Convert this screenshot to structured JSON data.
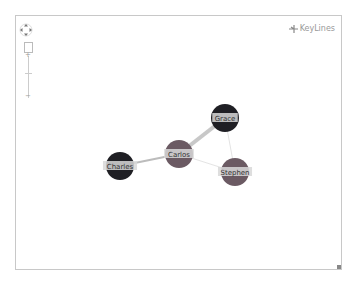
{
  "logo": {
    "text": "KeyLines"
  },
  "controls": {
    "navigate_icon": "pan-arrows-icon",
    "zoom_in": "+",
    "zoom_out": "−"
  },
  "graph": {
    "nodes": [
      {
        "id": "grace",
        "label": "Grace",
        "x": 225,
        "y": 118,
        "r": 14,
        "color": "#1f1f24"
      },
      {
        "id": "carlos",
        "label": "Carlos",
        "x": 179,
        "y": 154,
        "r": 14,
        "color": "#6b5a63"
      },
      {
        "id": "charles",
        "label": "Charles",
        "x": 120,
        "y": 166,
        "r": 14,
        "color": "#1f1f24"
      },
      {
        "id": "stephen",
        "label": "Stephen",
        "x": 235,
        "y": 172,
        "r": 14,
        "color": "#6b5a63"
      }
    ],
    "links": [
      {
        "from": "carlos",
        "to": "grace",
        "width": 4,
        "color": "#c8c8c8"
      },
      {
        "from": "carlos",
        "to": "charles",
        "width": 2,
        "color": "#bcbcbc"
      },
      {
        "from": "carlos",
        "to": "stephen",
        "width": 1,
        "color": "#e4e4e4"
      },
      {
        "from": "grace",
        "to": "stephen",
        "width": 1,
        "color": "#e4e4e4"
      }
    ]
  }
}
